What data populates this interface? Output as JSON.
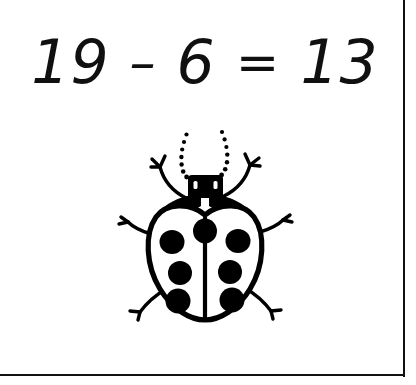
{
  "page": {
    "background_color": "#ffffff",
    "ink_color": "#101010"
  },
  "frame": {
    "right_rule_name": "right-border-rule",
    "bottom_rule_name": "bottom-border-rule",
    "color": "#111111"
  },
  "equation": {
    "full_text": "19 − 6 = 13",
    "left_operand": "19",
    "operator": "–",
    "right_operand": "6",
    "equals": "=",
    "result": "13"
  },
  "illustration": {
    "subject": "ladybug",
    "icon_name": "ladybug-illustration",
    "style": "black-and-white line drawing",
    "wing_spot_count": 6,
    "scutellum_spot_count": 1,
    "total_spot_count": 7,
    "leg_count": 6,
    "antenna_count": 2,
    "body_fill": "#ffffff",
    "outline_color": "#000000"
  }
}
